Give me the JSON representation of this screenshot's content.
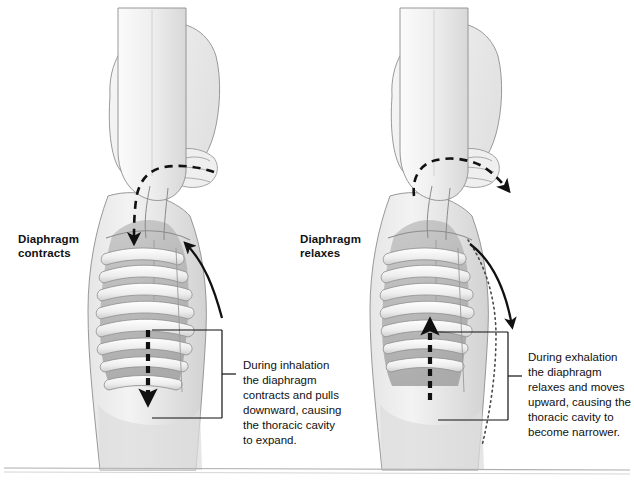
{
  "figure": {
    "background_color": "#ffffff",
    "line_color": "#111111",
    "body_fill": "#f2f2f2",
    "cavity_fill": "#b9b9b9",
    "rib_fill": "#f4f4f4",
    "shadow_fill": "#cfcfcf"
  },
  "panels": [
    {
      "id": "inhalation",
      "label": "Diaphragm\ncontracts",
      "caption": "During inhalation\nthe diaphragm\ncontracts and pulls\ndownward, causing\nthe thoracic cavity\nto expand.",
      "airflow_direction": "in",
      "diaphragm_arrow_direction": "down",
      "chest_arrow_direction": "up",
      "has_dotted_outline": false
    },
    {
      "id": "exhalation",
      "label": "Diaphragm\nrelaxes",
      "caption": "During exhalation\nthe diaphragm\nrelaxes and moves\nupward, causing the\nthoracic cavity to\nbecome narrower.",
      "airflow_direction": "out",
      "diaphragm_arrow_direction": "up",
      "chest_arrow_direction": "down",
      "has_dotted_outline": true
    }
  ],
  "annotations": {
    "bracket_label": "callout-bracket",
    "baseline_rule": "bottom-divider"
  }
}
